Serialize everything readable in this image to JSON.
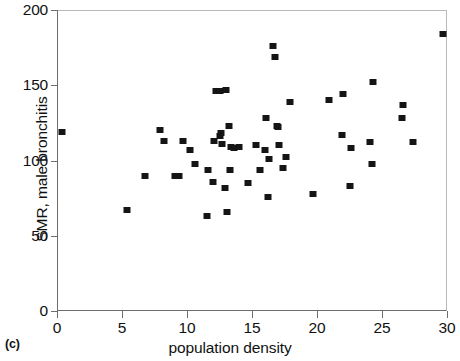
{
  "figure": {
    "panel_caption": "(c)",
    "marker_color": "#151515",
    "axis_color": "#6e6e6e",
    "background": "#ffffff"
  },
  "chart_data": {
    "type": "scatter",
    "title": "",
    "subtitle": "",
    "xlabel": "population density",
    "ylabel": "SMR, male bronchitis",
    "xlim": [
      0,
      30
    ],
    "ylim": [
      0,
      200
    ],
    "xticks": [
      0,
      5,
      10,
      15,
      20,
      25,
      30
    ],
    "yticks": [
      0,
      50,
      100,
      150,
      200
    ],
    "xtick_labels": [
      "0",
      "5",
      "10",
      "15",
      "20",
      "25",
      "30"
    ],
    "ytick_labels": [
      "0",
      "50",
      "100",
      "150",
      "200"
    ],
    "grid": false,
    "legend": null,
    "marker": "square",
    "n_points": 58,
    "points": [
      [
        0.4,
        119
      ],
      [
        5.4,
        67
      ],
      [
        6.8,
        90
      ],
      [
        7.9,
        120
      ],
      [
        8.2,
        113
      ],
      [
        9.1,
        90
      ],
      [
        9.4,
        90
      ],
      [
        9.7,
        113
      ],
      [
        10.2,
        107
      ],
      [
        10.6,
        98
      ],
      [
        11.5,
        63
      ],
      [
        11.6,
        94
      ],
      [
        12.0,
        86
      ],
      [
        12.1,
        113
      ],
      [
        12.2,
        146
      ],
      [
        12.5,
        146
      ],
      [
        12.5,
        116
      ],
      [
        12.6,
        118
      ],
      [
        12.7,
        111
      ],
      [
        12.9,
        82
      ],
      [
        13.0,
        147
      ],
      [
        13.1,
        66
      ],
      [
        13.2,
        123
      ],
      [
        13.3,
        94
      ],
      [
        13.4,
        109
      ],
      [
        13.6,
        108
      ],
      [
        14.0,
        109
      ],
      [
        14.7,
        85
      ],
      [
        15.3,
        110
      ],
      [
        15.6,
        94
      ],
      [
        16.0,
        107
      ],
      [
        16.1,
        128
      ],
      [
        16.2,
        76
      ],
      [
        16.3,
        101
      ],
      [
        16.6,
        176
      ],
      [
        16.8,
        169
      ],
      [
        16.9,
        123
      ],
      [
        17.0,
        122
      ],
      [
        17.1,
        110
      ],
      [
        17.4,
        95
      ],
      [
        17.6,
        102
      ],
      [
        17.9,
        139
      ],
      [
        19.7,
        78
      ],
      [
        20.9,
        140
      ],
      [
        21.9,
        117
      ],
      [
        22.0,
        144
      ],
      [
        22.5,
        83
      ],
      [
        22.6,
        108
      ],
      [
        24.1,
        112
      ],
      [
        24.2,
        98
      ],
      [
        24.3,
        152
      ],
      [
        26.5,
        128
      ],
      [
        26.6,
        137
      ],
      [
        27.4,
        112
      ],
      [
        29.7,
        184
      ]
    ]
  }
}
